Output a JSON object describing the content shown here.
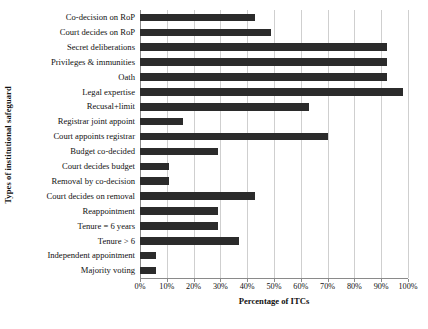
{
  "chart_data": {
    "type": "bar",
    "orientation": "horizontal",
    "title": "",
    "xlabel": "Percentage of ITCs",
    "ylabel": "Types of institutional safeguard",
    "xlim": [
      0,
      100
    ],
    "xtick_labels": [
      "0%",
      "10%",
      "20%",
      "30%",
      "40%",
      "50%",
      "60%",
      "70%",
      "80%",
      "90%",
      "100%"
    ],
    "xtick_values": [
      0,
      10,
      20,
      30,
      40,
      50,
      60,
      70,
      80,
      90,
      100
    ],
    "grid": "vertical",
    "legend": "none",
    "bar_color": "#2b2b2b",
    "categories": [
      "Co-decision on RoP",
      "Court decides on RoP",
      "Secret deliberations",
      "Privileges & immunities",
      "Oath",
      "Legal expertise",
      "Recusal+limit",
      "Registrar joint appoint",
      "Court appoints registrar",
      "Budget co-decided",
      "Court decides budget",
      "Removal by co-decision",
      "Court decides on removal",
      "Reappointment",
      "Tenure = 6 years",
      "Tenure > 6",
      "Independent appointment",
      "Majority voting"
    ],
    "values": [
      43,
      49,
      92,
      92,
      92,
      98,
      63,
      16,
      70,
      29,
      11,
      11,
      43,
      29,
      29,
      37,
      6,
      6
    ]
  }
}
